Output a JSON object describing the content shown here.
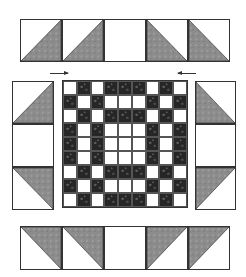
{
  "diagram": {
    "title": "",
    "colors": {
      "gray_fabric": "#8c8c8c",
      "dark_fabric": "#262626",
      "light_fabric": "#ffffff",
      "outline": "#333333"
    },
    "top_border": {
      "units": [
        {
          "type": "hst",
          "dark_corner": "bottom-right"
        },
        {
          "type": "hst",
          "dark_corner": "bottom-right"
        },
        {
          "type": "plain"
        },
        {
          "type": "hst",
          "dark_corner": "bottom-left"
        },
        {
          "type": "hst",
          "dark_corner": "bottom-left"
        }
      ]
    },
    "left_border": {
      "units": [
        {
          "type": "hst",
          "dark_corner": "bottom-right"
        },
        {
          "type": "plain"
        },
        {
          "type": "hst",
          "dark_corner": "top-right"
        }
      ]
    },
    "right_border": {
      "units": [
        {
          "type": "hst",
          "dark_corner": "bottom-left"
        },
        {
          "type": "plain"
        },
        {
          "type": "hst",
          "dark_corner": "top-left"
        }
      ]
    },
    "bottom_border": {
      "units": [
        {
          "type": "hst",
          "dark_corner": "top-right"
        },
        {
          "type": "hst",
          "dark_corner": "top-right"
        },
        {
          "type": "plain"
        },
        {
          "type": "hst",
          "dark_corner": "top-left"
        },
        {
          "type": "hst",
          "dark_corner": "top-left"
        }
      ]
    },
    "center_block": {
      "grid": [
        "WDWDDDWDW",
        "DWDWWWDWD",
        "WDWDDDWDW",
        "DWDWWWDWD",
        "DWDWWWDWD",
        "DWDWWWDWD",
        "WDWDDDWDW",
        "DWDWWWDWD",
        "WDWDDDWDW"
      ]
    },
    "arrows": [
      {
        "direction": "right",
        "position": "top-left of center block"
      },
      {
        "direction": "left",
        "position": "top-right of center block"
      }
    ]
  }
}
